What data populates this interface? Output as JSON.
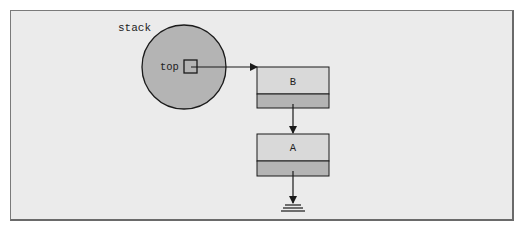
{
  "diagram": {
    "type": "linked-list-stack",
    "stack_label": "stack",
    "pointer_label": "top",
    "nodes": [
      {
        "id": "B",
        "label": "B"
      },
      {
        "id": "A",
        "label": "A"
      }
    ],
    "terminator": "null-ground",
    "colors": {
      "panel_bg": "#ebebeb",
      "panel_border": "#7a7a7a",
      "circle_fill": "#b4b4b4",
      "node_top_fill": "#d9d9d9",
      "node_bottom_fill": "#b4b4b4",
      "stroke": "#1a1a1a"
    }
  }
}
